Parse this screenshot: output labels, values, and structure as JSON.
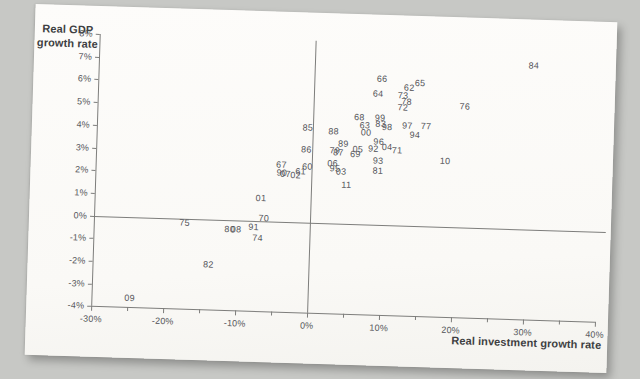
{
  "scene": {
    "background_color": "#c7c8c5",
    "paper_color": "#fbfaf7",
    "ink_color": "#55565a",
    "line_color": "#7d7d7b"
  },
  "chart_data": {
    "type": "scatter",
    "title": "",
    "xlabel": "Real investment growth rate",
    "ylabel": "Real GDP growth rate",
    "ylabel_lines": [
      "Real GDP",
      "growth rate"
    ],
    "xlim": [
      -30,
      40
    ],
    "ylim": [
      -4,
      8
    ],
    "x_major_tick_step": 10,
    "x_minor_tick_step": 5,
    "y_tick_step": 1,
    "x_tick_labels": [
      "-30%",
      "-20%",
      "-10%",
      "0%",
      "10%",
      "20%",
      "30%",
      "40%"
    ],
    "y_tick_labels": [
      "8%",
      "7%",
      "6%",
      "5%",
      "4%",
      "3%",
      "2%",
      "1%",
      "0%",
      "-1%",
      "-2%",
      "-3%",
      "-4%"
    ],
    "grid": false,
    "zero_lines": true,
    "legend": "none",
    "point_style": "year-text-label",
    "points": [
      {
        "label": "60",
        "x": -0.6,
        "y": 2.45
      },
      {
        "label": "61",
        "x": -1.5,
        "y": 2.25
      },
      {
        "label": "62",
        "x": 13.2,
        "y": 6.05
      },
      {
        "label": "63",
        "x": 7.2,
        "y": 4.35
      },
      {
        "label": "64",
        "x": 8.9,
        "y": 5.75
      },
      {
        "label": "65",
        "x": 14.7,
        "y": 6.3
      },
      {
        "label": "66",
        "x": 9.4,
        "y": 6.4
      },
      {
        "label": "67",
        "x": -4.2,
        "y": 2.5
      },
      {
        "label": "68",
        "x": 6.4,
        "y": 4.7
      },
      {
        "label": "69",
        "x": 6.0,
        "y": 3.08
      },
      {
        "label": "70",
        "x": -6.4,
        "y": 0.1
      },
      {
        "label": "71",
        "x": 11.8,
        "y": 3.3
      },
      {
        "label": "72",
        "x": 12.4,
        "y": 5.2
      },
      {
        "label": "73",
        "x": 12.4,
        "y": 5.7
      },
      {
        "label": "74",
        "x": -7.2,
        "y": -0.75
      },
      {
        "label": "75",
        "x": -17.4,
        "y": -0.2
      },
      {
        "label": "76",
        "x": 21.0,
        "y": 5.3
      },
      {
        "label": "77",
        "x": 15.7,
        "y": 4.4
      },
      {
        "label": "78",
        "x": 12.9,
        "y": 5.45
      },
      {
        "label": "79",
        "x": 3.15,
        "y": 3.2
      },
      {
        "label": "80",
        "x": -11.1,
        "y": -0.42
      },
      {
        "label": "81",
        "x": 9.2,
        "y": 2.35
      },
      {
        "label": "82",
        "x": -13.9,
        "y": -2.0
      },
      {
        "label": "83",
        "x": 9.4,
        "y": 4.45
      },
      {
        "label": "84",
        "x": 30.4,
        "y": 7.2
      },
      {
        "label": "85",
        "x": -0.7,
        "y": 4.15
      },
      {
        "label": "86",
        "x": -0.8,
        "y": 3.2
      },
      {
        "label": "87",
        "x": 3.65,
        "y": 3.1
      },
      {
        "label": "88",
        "x": 2.9,
        "y": 4.05
      },
      {
        "label": "89",
        "x": 4.3,
        "y": 3.5
      },
      {
        "label": "90",
        "x": -4.1,
        "y": 2.15
      },
      {
        "label": "91",
        "x": -7.8,
        "y": -0.3
      },
      {
        "label": "92",
        "x": 8.5,
        "y": 3.35
      },
      {
        "label": "93",
        "x": 9.2,
        "y": 2.8
      },
      {
        "label": "94",
        "x": 14.2,
        "y": 4.0
      },
      {
        "label": "95",
        "x": 3.25,
        "y": 2.42
      },
      {
        "label": "96",
        "x": 9.2,
        "y": 3.65
      },
      {
        "label": "97",
        "x": 13.1,
        "y": 4.4
      },
      {
        "label": "98",
        "x": 10.3,
        "y": 4.28
      },
      {
        "label": "99",
        "x": 9.3,
        "y": 4.7
      },
      {
        "label": "00",
        "x": 7.4,
        "y": 4.05
      },
      {
        "label": "01",
        "x": -6.9,
        "y": 1.0
      },
      {
        "label": "02",
        "x": -2.2,
        "y": 2.05
      },
      {
        "label": "03",
        "x": 4.1,
        "y": 2.28
      },
      {
        "label": "04",
        "x": 10.4,
        "y": 3.4
      },
      {
        "label": "05",
        "x": 6.35,
        "y": 3.28
      },
      {
        "label": "06",
        "x": 2.9,
        "y": 2.62
      },
      {
        "label": "07",
        "x": -3.6,
        "y": 2.1
      },
      {
        "label": "08",
        "x": -10.2,
        "y": -0.42
      },
      {
        "label": "09",
        "x": -24.7,
        "y": -3.6
      },
      {
        "label": "10",
        "x": 18.5,
        "y": 2.9
      },
      {
        "label": "11",
        "x": 4.9,
        "y": 1.7
      }
    ]
  }
}
